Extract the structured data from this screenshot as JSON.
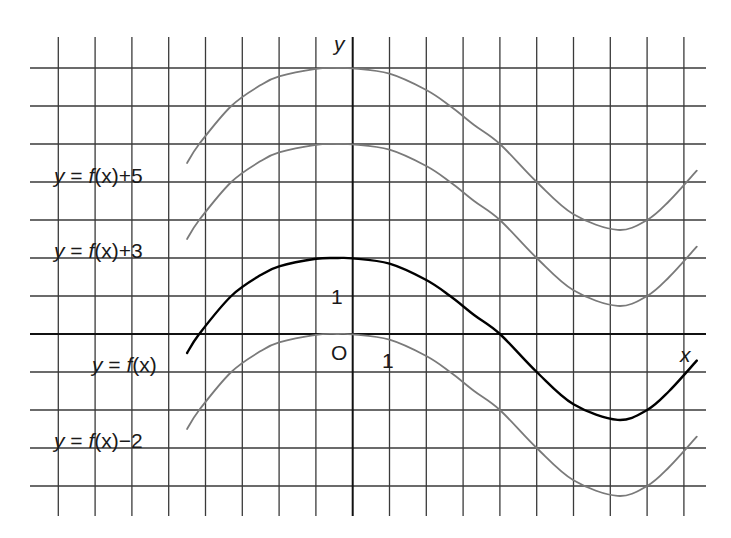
{
  "chart_data": {
    "type": "line",
    "title": "",
    "xlabel": "x",
    "ylabel": "y",
    "origin_label": "O",
    "x_tick_label": "1",
    "y_tick_label": "1",
    "xlim": [
      -8,
      9
    ],
    "ylim": [
      -4,
      7
    ],
    "grid": true,
    "grid_step": 1,
    "colors": {
      "grid": "#3a3a3a",
      "base_curve": "#000000",
      "shifted_curve": "#7a7a7a"
    },
    "base_points": [
      [
        -4.5,
        -0.5
      ],
      [
        -4.17,
        0
      ],
      [
        -3.3,
        1
      ],
      [
        -2.5,
        1.55
      ],
      [
        -2,
        1.78
      ],
      [
        -1,
        1.98
      ],
      [
        -0.4,
        2.0
      ],
      [
        0,
        1.99
      ],
      [
        1,
        1.85
      ],
      [
        2,
        1.42
      ],
      [
        2.65,
        1.0
      ],
      [
        3.3,
        0.5
      ],
      [
        4,
        0
      ],
      [
        5,
        -1
      ],
      [
        6,
        -1.85
      ],
      [
        7.2,
        -2.26
      ],
      [
        8,
        -2.0
      ],
      [
        8.6,
        -1.5
      ],
      [
        9.35,
        -0.7
      ]
    ],
    "series": [
      {
        "name": "y = f(x)+5",
        "shift": 5,
        "role": "shifted",
        "label_parts": [
          "y",
          " = ",
          "f",
          "(x)+5"
        ],
        "label_pos": [
          54,
          183
        ]
      },
      {
        "name": "y = f(x)+3",
        "shift": 3,
        "role": "shifted",
        "label_parts": [
          "y",
          " = ",
          "f",
          "(x)+3"
        ],
        "label_pos": [
          54,
          258
        ]
      },
      {
        "name": "y = f(x)",
        "shift": 0,
        "role": "base",
        "label_parts": [
          "y",
          " = ",
          "f",
          "(x)"
        ],
        "label_pos": [
          92,
          372
        ]
      },
      {
        "name": "y = f(x)−2",
        "shift": -2,
        "role": "shifted",
        "label_parts": [
          "y",
          " = ",
          "f",
          "(x)−2"
        ],
        "label_pos": [
          54,
          448
        ]
      }
    ],
    "annotations": [
      {
        "text": "y",
        "note": "y-axis label"
      },
      {
        "text": "x",
        "note": "x-axis label"
      },
      {
        "text": "O",
        "note": "origin"
      },
      {
        "text": "1",
        "note": "unit tick on y-axis"
      },
      {
        "text": "1",
        "note": "unit tick on x-axis"
      }
    ]
  }
}
